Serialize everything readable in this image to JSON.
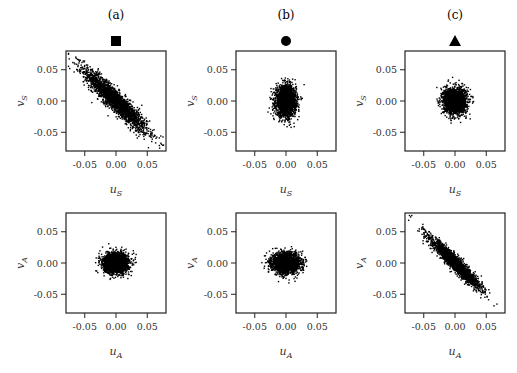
{
  "chart_data": {
    "type": "scatter",
    "layout": "2x3 grid",
    "columns": [
      {
        "title": "(a)",
        "marker": "square"
      },
      {
        "title": "(b)",
        "marker": "circle"
      },
      {
        "title": "(c)",
        "marker": "triangle"
      }
    ],
    "xticks": [
      "-0.05",
      "0.00",
      "0.05"
    ],
    "yticks": [
      "0.05",
      "0.00",
      "-0.05"
    ],
    "tick_values": [
      -0.05,
      0.0,
      0.05
    ],
    "xlim": [
      -0.08,
      0.08
    ],
    "ylim": [
      -0.08,
      0.08
    ],
    "grid": false,
    "panels": [
      {
        "id": "a-top",
        "row": 0,
        "col": 0,
        "xlabel": "u",
        "xsub": "S",
        "ylabel": "v",
        "ysub": "S",
        "cloud": {
          "cx": 0.0,
          "cy": 0.0,
          "sx": 0.025,
          "sy": 0.025,
          "corr": -0.93,
          "extent": [
            -0.07,
            0.065
          ]
        }
      },
      {
        "id": "b-top",
        "row": 0,
        "col": 1,
        "xlabel": "u",
        "xsub": "S",
        "ylabel": "v",
        "ysub": "S",
        "cloud": {
          "cx": 0.0,
          "cy": 0.0,
          "sx": 0.008,
          "sy": 0.012,
          "corr": 0.0,
          "extent": [
            -0.03,
            0.03
          ]
        }
      },
      {
        "id": "c-top",
        "row": 0,
        "col": 2,
        "xlabel": "u",
        "xsub": "S",
        "ylabel": "v",
        "ysub": "S",
        "cloud": {
          "cx": 0.0,
          "cy": 0.0,
          "sx": 0.009,
          "sy": 0.01,
          "corr": 0.0,
          "extent": [
            -0.03,
            0.03
          ]
        }
      },
      {
        "id": "a-bottom",
        "row": 1,
        "col": 0,
        "xlabel": "u",
        "xsub": "A",
        "ylabel": "v",
        "ysub": "A",
        "cloud": {
          "cx": 0.0,
          "cy": 0.0,
          "sx": 0.01,
          "sy": 0.008,
          "corr": 0.0,
          "extent": [
            -0.03,
            0.03
          ]
        }
      },
      {
        "id": "b-bottom",
        "row": 1,
        "col": 1,
        "xlabel": "u",
        "xsub": "A",
        "ylabel": "v",
        "ysub": "A",
        "cloud": {
          "cx": 0.0,
          "cy": 0.0,
          "sx": 0.011,
          "sy": 0.008,
          "corr": 0.0,
          "extent": [
            -0.03,
            0.03
          ]
        }
      },
      {
        "id": "c-bottom",
        "row": 1,
        "col": 2,
        "xlabel": "u",
        "xsub": "A",
        "ylabel": "v",
        "ysub": "A",
        "cloud": {
          "cx": 0.0,
          "cy": 0.0,
          "sx": 0.02,
          "sy": 0.02,
          "corr": -0.95,
          "extent": [
            -0.05,
            0.05
          ]
        }
      }
    ]
  },
  "colors": {
    "points": "#000000",
    "axes": "#222222",
    "background": "#ffffff"
  }
}
